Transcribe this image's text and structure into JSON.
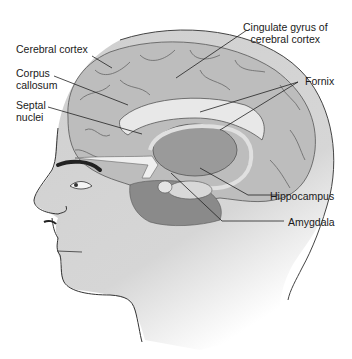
{
  "figure": {
    "labels": {
      "cerebral_cortex": "Cerebral cortex",
      "corpus_callosum_line1": "Corpus",
      "corpus_callosum_line2": "callosum",
      "septal_nuclei_line1": "Septal",
      "septal_nuclei_line2": "nuclei",
      "cingulate_line1": "Cingulate gyrus of",
      "cingulate_line2": "cerebral cortex",
      "fornix": "Fornix",
      "hippocampus": "Hippocampus",
      "amygdala": "Amygdala"
    },
    "colors": {
      "skin": "#cfcfcf",
      "brain": "#b9b9b9",
      "outline": "#333333",
      "leader_line": "#222222",
      "text": "#1a1a1a"
    }
  }
}
